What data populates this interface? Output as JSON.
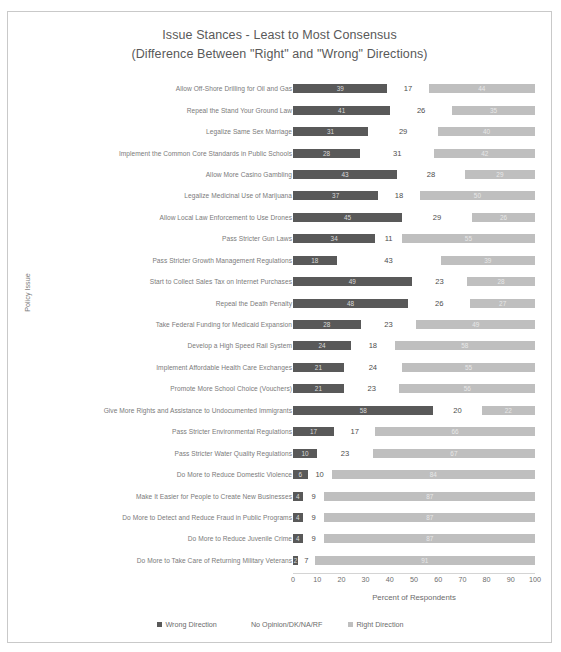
{
  "chart_data": {
    "type": "bar",
    "subtype": "stacked-horizontal",
    "title": "Issue Stances - Least to Most Consensus",
    "subtitle": "(Difference Between \"Right\" and \"Wrong\" Directions)",
    "xlabel": "Percent of Respondents",
    "ylabel": "Policy Issue",
    "xlim": [
      0,
      100
    ],
    "xticks": [
      0,
      10,
      20,
      30,
      40,
      50,
      60,
      70,
      80,
      90,
      100
    ],
    "grid": false,
    "legend_position": "bottom",
    "colors": {
      "wrong": "#595959",
      "no_opinion": "#ffffff",
      "right": "#bfbfbf"
    },
    "legend": [
      "Wrong Direction",
      "No Opinion/DK/NA/RF",
      "Right Direction"
    ],
    "categories": [
      "Allow Off-Shore Drilling for Oil and Gas",
      "Repeal the Stand Your Ground Law",
      "Legalize Same Sex Marriage",
      "Implement the Common Core Standards in Public Schools",
      "Allow More Casino Gambling",
      "Legalize Medicinal Use of Marijuana",
      "Allow Local Law Enforcement to Use Drones",
      "Pass Stricter Gun Laws",
      "Pass Stricter Growth Management Regulations",
      "Start to Collect Sales Tax on Internet Purchases",
      "Repeal the Death Penalty",
      "Take Federal Funding for Medicaid Expansion",
      "Develop a High Speed Rail System",
      "Implement Affordable Health Care Exchanges",
      "Promote More School Choice (Vouchers)",
      "Give More Rights and Assistance to Undocumented Immigrants",
      "Pass Stricter Environmental Regulations",
      "Pass Stricter Water Quality Regulations",
      "Do More to Reduce Domestic Violence",
      "Make It Easier for People to Create New Businesses",
      "Do More to Detect and Reduce Fraud in Public Programs",
      "Do More to Reduce Juvenile Crime",
      "Do More to Take Care of Returning Military Veterans"
    ],
    "series": [
      {
        "name": "Wrong Direction",
        "values": [
          39,
          41,
          31,
          28,
          43,
          37,
          45,
          34,
          18,
          49,
          48,
          28,
          24,
          21,
          21,
          58,
          17,
          10,
          6,
          4,
          4,
          4,
          2
        ]
      },
      {
        "name": "No Opinion/DK/NA/RF",
        "values": [
          17,
          26,
          29,
          31,
          28,
          18,
          29,
          11,
          43,
          23,
          26,
          23,
          18,
          24,
          23,
          20,
          17,
          23,
          10,
          9,
          9,
          9,
          7
        ]
      },
      {
        "name": "Right Direction",
        "values": [
          44,
          35,
          40,
          42,
          29,
          50,
          26,
          55,
          39,
          28,
          27,
          49,
          58,
          55,
          56,
          22,
          66,
          67,
          84,
          87,
          87,
          87,
          91
        ]
      }
    ]
  }
}
